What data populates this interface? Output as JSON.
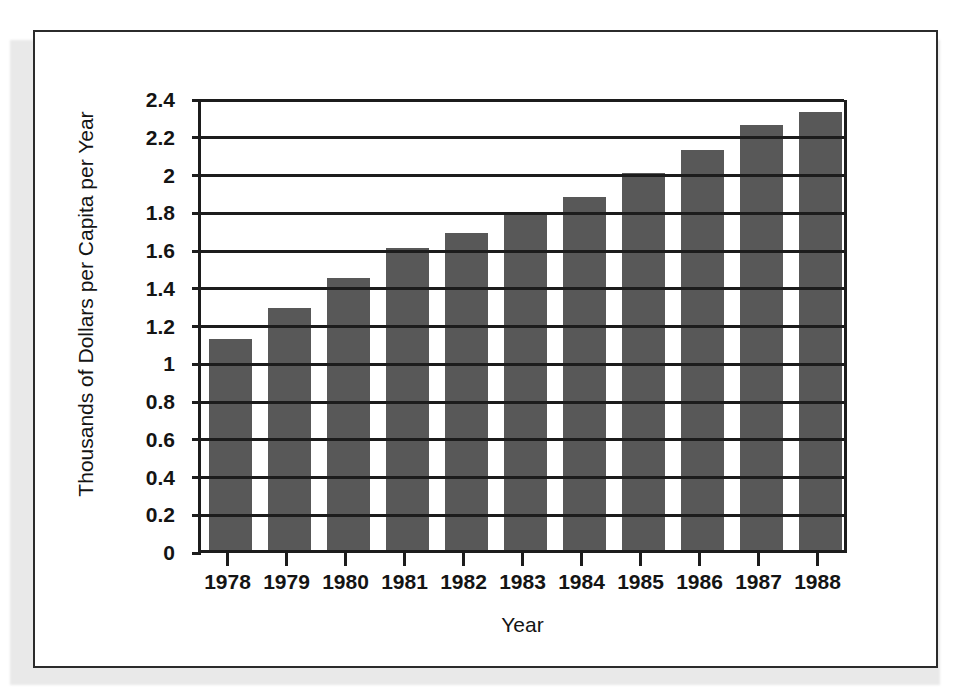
{
  "chart_data": {
    "type": "bar",
    "title": "",
    "xlabel": "Year",
    "ylabel": "Thousands of Dollars per Capita per Year",
    "categories": [
      "1978",
      "1979",
      "1980",
      "1981",
      "1982",
      "1983",
      "1984",
      "1985",
      "1986",
      "1987",
      "1988"
    ],
    "values": [
      1.12,
      1.28,
      1.44,
      1.6,
      1.68,
      1.78,
      1.87,
      2.0,
      2.12,
      2.25,
      2.32
    ],
    "series": [
      {
        "name": "Dollars per Capita per Year",
        "values": [
          1.12,
          1.28,
          1.44,
          1.6,
          1.68,
          1.78,
          1.87,
          2.0,
          2.12,
          2.25,
          2.32
        ]
      }
    ],
    "ylim": [
      0,
      2.4
    ],
    "ytick_labels": [
      "2.4",
      "2.2",
      "2",
      "1.8",
      "1.6",
      "1.4",
      "1.2",
      "1",
      "0.8",
      "0.6",
      "0.4",
      "0.2",
      "0"
    ],
    "ytick_values": [
      2.4,
      2.2,
      2.0,
      1.8,
      1.6,
      1.4,
      1.2,
      1.0,
      0.8,
      0.6,
      0.4,
      0.2,
      0
    ],
    "grid": true,
    "grid_axis": "y",
    "legend": "none",
    "bar_color": "#585858",
    "axis_color": "#1c1c1c",
    "background_color": "#ffffff"
  }
}
